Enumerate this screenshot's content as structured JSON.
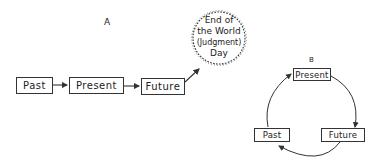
{
  "diagram_a": {
    "label": "A",
    "nodes": [
      {
        "id": "past",
        "label": "Past"
      },
      {
        "id": "present",
        "label": "Present"
      },
      {
        "id": "future",
        "label": "Future"
      }
    ],
    "end_node": {
      "line1": "End of",
      "line2": "the World",
      "line3": "(Judgment)",
      "line4": "Day"
    },
    "edges": [
      {
        "from": "past",
        "to": "present"
      },
      {
        "from": "present",
        "to": "future"
      },
      {
        "from": "future",
        "to": "end_of_world"
      }
    ]
  },
  "diagram_b": {
    "label": "B",
    "nodes": [
      {
        "id": "present",
        "label": "Present"
      },
      {
        "id": "future",
        "label": "Future"
      },
      {
        "id": "past",
        "label": "Past"
      }
    ],
    "edges": [
      {
        "from": "present",
        "to": "future"
      },
      {
        "from": "future",
        "to": "past"
      },
      {
        "from": "past",
        "to": "present"
      }
    ]
  },
  "colors": {
    "stroke": "#333333",
    "background": "#ffffff"
  }
}
